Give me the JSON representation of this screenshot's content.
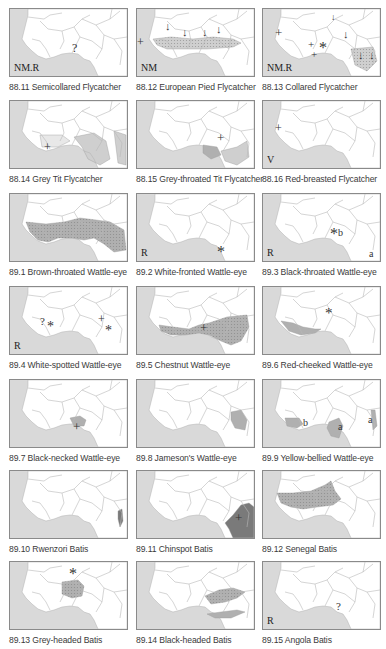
{
  "colors": {
    "sea": "#d9d9d9",
    "land": "#ffffff",
    "border": "#b8b8b8",
    "range_light": "#cfcfcf",
    "range_medium": "#b0b0b0",
    "range_dark": "#7a7a7a",
    "frame": "#8a8a8a",
    "caption_text": "#3a3a3a"
  },
  "legend_symbols": {
    "vagrant_record": "+",
    "breeding_record": "*",
    "uncertain": "?",
    "migration_arrow": "↓"
  },
  "maps": [
    {
      "id": "88.11",
      "caption": "88.11 Semicollared Flycatcher",
      "status": "NM.R",
      "marks": [
        {
          "glyph": "?",
          "x": 62,
          "y": 33,
          "size": 12
        }
      ],
      "range": "none"
    },
    {
      "id": "88.12",
      "caption": "88.12 European Pied Flycatcher",
      "status": "NM",
      "marks": [
        {
          "glyph": "↓",
          "x": 28,
          "y": 12,
          "size": 11
        },
        {
          "glyph": "↓",
          "x": 45,
          "y": 18,
          "size": 11
        },
        {
          "glyph": "↓",
          "x": 65,
          "y": 18,
          "size": 11
        },
        {
          "glyph": "↓",
          "x": 79,
          "y": 15,
          "size": 11
        },
        {
          "glyph": "+",
          "x": 0,
          "y": 27,
          "size": 12
        }
      ],
      "range": "sahel-light"
    },
    {
      "id": "88.13",
      "caption": "88.13 Collared Flycatcher",
      "status": "NM.R",
      "marks": [
        {
          "glyph": "↓",
          "x": 68,
          "y": 4,
          "size": 9
        },
        {
          "glyph": "↓",
          "x": 80,
          "y": 20,
          "size": 11
        },
        {
          "glyph": "↓",
          "x": 95,
          "y": 41,
          "size": 11
        },
        {
          "glyph": "↓",
          "x": 106,
          "y": 41,
          "size": 11
        },
        {
          "glyph": "+",
          "x": 12,
          "y": 17,
          "size": 13
        },
        {
          "glyph": "+",
          "x": 45,
          "y": 30,
          "size": 11
        },
        {
          "glyph": "+",
          "x": 48,
          "y": 40,
          "size": 11
        },
        {
          "glyph": "*",
          "x": 56,
          "y": 31,
          "size": 16
        }
      ],
      "range": "east-light"
    },
    {
      "id": "88.14",
      "caption": "88.14 Grey Tit Flycatcher",
      "status": "",
      "marks": [
        {
          "glyph": "+",
          "x": 34,
          "y": 40,
          "size": 12
        }
      ],
      "range": "coast-light"
    },
    {
      "id": "88.15",
      "caption": "88.15 Grey-throated Tit Flycatcher",
      "status": "",
      "marks": [
        {
          "glyph": "+",
          "x": 80,
          "y": 30,
          "size": 13
        }
      ],
      "range": "gulf-light"
    },
    {
      "id": "88.16",
      "caption": "88.16 Red-breasted Flycatcher",
      "status": "V",
      "marks": [
        {
          "glyph": "+",
          "x": 12,
          "y": 21,
          "size": 12
        }
      ],
      "range": "none"
    },
    {
      "id": "89.1",
      "caption": "89.1 Brown-throated Wattle-eye",
      "status": "",
      "marks": [],
      "range": "west-africa-medium"
    },
    {
      "id": "89.2",
      "caption": "89.2 White-fronted Wattle-eye",
      "status": "R",
      "marks": [
        {
          "glyph": "*",
          "x": 80,
          "y": 50,
          "size": 16
        }
      ],
      "range": "none"
    },
    {
      "id": "89.3",
      "caption": "89.3 Black-throated Wattle-eye",
      "status": "R",
      "marks": [
        {
          "glyph": "*",
          "x": 67,
          "y": 32,
          "size": 16
        },
        {
          "glyph": "b",
          "x": 75,
          "y": 34,
          "size": 10
        },
        {
          "glyph": "a",
          "x": 106,
          "y": 55,
          "size": 10
        }
      ],
      "range": "none"
    },
    {
      "id": "89.4",
      "caption": "89.4 White-spotted Wattle-eye",
      "status": "R",
      "marks": [
        {
          "glyph": "?",
          "x": 30,
          "y": 29,
          "size": 11
        },
        {
          "glyph": "*",
          "x": 37,
          "y": 33,
          "size": 14
        },
        {
          "glyph": "+",
          "x": 88,
          "y": 26,
          "size": 12
        },
        {
          "glyph": "*",
          "x": 95,
          "y": 37,
          "size": 14
        }
      ],
      "range": "none"
    },
    {
      "id": "89.5",
      "caption": "89.5 Chestnut Wattle-eye",
      "status": "",
      "marks": [
        {
          "glyph": "+",
          "x": 63,
          "y": 34,
          "size": 13
        }
      ],
      "range": "gulf-dots"
    },
    {
      "id": "89.6",
      "caption": "89.6 Red-cheeked Wattle-eye",
      "status": "",
      "marks": [
        {
          "glyph": "*",
          "x": 62,
          "y": 19,
          "size": 15
        }
      ],
      "range": "coast-west"
    },
    {
      "id": "89.7",
      "caption": "89.7 Black-necked Wattle-eye",
      "status": "",
      "marks": [
        {
          "glyph": "+",
          "x": 63,
          "y": 40,
          "size": 13
        }
      ],
      "range": "nigeria-spot"
    },
    {
      "id": "89.8",
      "caption": "89.8 Jameson's Wattle-eye",
      "status": "",
      "marks": [],
      "range": "east-spot"
    },
    {
      "id": "89.9",
      "caption": "89.9 Yellow-bellied Wattle-eye",
      "status": "",
      "marks": [
        {
          "glyph": "b",
          "x": 40,
          "y": 38,
          "size": 10
        },
        {
          "glyph": "a",
          "x": 75,
          "y": 42,
          "size": 10
        },
        {
          "glyph": "a",
          "x": 105,
          "y": 35,
          "size": 10
        }
      ],
      "range": "three-spots"
    },
    {
      "id": "89.10",
      "caption": "89.10 Rwenzori Batis",
      "status": "",
      "marks": [],
      "range": "east-sliver"
    },
    {
      "id": "89.11",
      "caption": "89.11 Chinspot Batis",
      "status": "",
      "marks": [
        {
          "glyph": "+",
          "x": 98,
          "y": 40,
          "size": 13
        }
      ],
      "range": "southeast-dark"
    },
    {
      "id": "89.12",
      "caption": "89.12 Senegal Batis",
      "status": "",
      "marks": [],
      "range": "sahel-dark"
    },
    {
      "id": "89.13",
      "caption": "89.13 Grey-headed Batis",
      "status": "",
      "marks": [
        {
          "glyph": "*",
          "x": 59,
          "y": 4,
          "size": 16
        }
      ],
      "range": "chad-block"
    },
    {
      "id": "89.14",
      "caption": "89.14 Black-headed Batis",
      "status": "",
      "marks": [],
      "range": "central-band"
    },
    {
      "id": "89.15",
      "caption": "89.15 Angola Batis",
      "status": "R",
      "marks": [
        {
          "glyph": "?",
          "x": 73,
          "y": 39,
          "size": 11
        }
      ],
      "range": "none"
    }
  ]
}
